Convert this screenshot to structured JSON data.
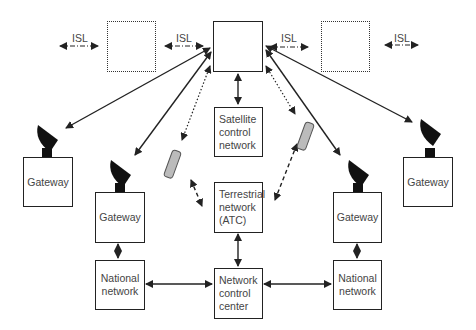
{
  "diagram": {
    "isl_labels": [
      "ISL",
      "ISL",
      "ISL",
      "ISL"
    ],
    "satellites": [
      {
        "id": "sat-left",
        "style": "dotted"
      },
      {
        "id": "sat-center",
        "style": "solid"
      },
      {
        "id": "sat-right",
        "style": "dotted"
      }
    ],
    "nodes": {
      "satellite_control": "Satellite\ncontrol\nnetwork",
      "terrestrial": "Terrestrial\nnetwork\n(ATC)",
      "ncc": "Network\ncontrol\ncenter",
      "gateway_far_left": "Gateway",
      "gateway_left": "Gateway",
      "gateway_right": "Gateway",
      "gateway_far_right": "Gateway",
      "national_left": "National\nnetwork",
      "national_right": "National\nnetwork"
    },
    "colors": {
      "line": "#222222",
      "box_border": "#222222",
      "text": "#444444"
    }
  }
}
